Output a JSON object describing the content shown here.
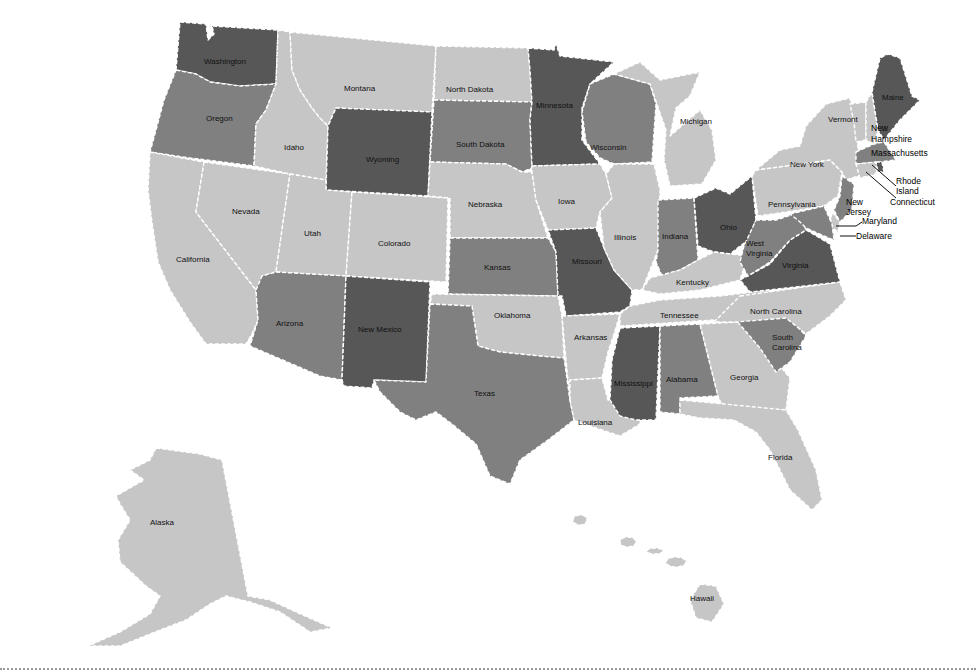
{
  "map": {
    "type": "choropleth",
    "region": "United States",
    "palette": {
      "level1": "#c6c6c6",
      "level2": "#a3a3a3",
      "level3": "#808080",
      "level4": "#575757",
      "border": "#ffffff",
      "label": "#111111"
    },
    "states": [
      {
        "id": "WA",
        "name": "Washington",
        "level": 4
      },
      {
        "id": "OR",
        "name": "Oregon",
        "level": 3
      },
      {
        "id": "CA",
        "name": "California",
        "level": 1
      },
      {
        "id": "NV",
        "name": "Nevada",
        "level": 1
      },
      {
        "id": "ID",
        "name": "Idaho",
        "level": 1
      },
      {
        "id": "MT",
        "name": "Montana",
        "level": 1
      },
      {
        "id": "WY",
        "name": "Wyoming",
        "level": 4
      },
      {
        "id": "UT",
        "name": "Utah",
        "level": 1
      },
      {
        "id": "CO",
        "name": "Colorado",
        "level": 1
      },
      {
        "id": "AZ",
        "name": "Arizona",
        "level": 3
      },
      {
        "id": "NM",
        "name": "New Mexico",
        "level": 4
      },
      {
        "id": "ND",
        "name": "North Dakota",
        "level": 1
      },
      {
        "id": "SD",
        "name": "South Dakota",
        "level": 3
      },
      {
        "id": "NE",
        "name": "Nebraska",
        "level": 1
      },
      {
        "id": "KS",
        "name": "Kansas",
        "level": 3
      },
      {
        "id": "OK",
        "name": "Oklahoma",
        "level": 1
      },
      {
        "id": "TX",
        "name": "Texas",
        "level": 3
      },
      {
        "id": "MN",
        "name": "Minnesota",
        "level": 4
      },
      {
        "id": "IA",
        "name": "Iowa",
        "level": 1
      },
      {
        "id": "MO",
        "name": "Missouri",
        "level": 4
      },
      {
        "id": "AR",
        "name": "Arkansas",
        "level": 1
      },
      {
        "id": "LA",
        "name": "Louisiana",
        "level": 1
      },
      {
        "id": "WI",
        "name": "Wisconsin",
        "level": 3
      },
      {
        "id": "IL",
        "name": "Illinois",
        "level": 1
      },
      {
        "id": "MI",
        "name": "Michigan",
        "level": 1
      },
      {
        "id": "IN",
        "name": "Indiana",
        "level": 3
      },
      {
        "id": "OH",
        "name": "Ohio",
        "level": 4
      },
      {
        "id": "KY",
        "name": "Kentucky",
        "level": 1
      },
      {
        "id": "TN",
        "name": "Tennessee",
        "level": 1
      },
      {
        "id": "MS",
        "name": "Mississippi",
        "level": 4
      },
      {
        "id": "AL",
        "name": "Alabama",
        "level": 3
      },
      {
        "id": "GA",
        "name": "Georgia",
        "level": 1
      },
      {
        "id": "FL",
        "name": "Florida",
        "level": 1
      },
      {
        "id": "SC",
        "name": "South Carolina",
        "level": 3
      },
      {
        "id": "NC",
        "name": "North Carolina",
        "level": 1
      },
      {
        "id": "VA",
        "name": "Virginia",
        "level": 4
      },
      {
        "id": "WV",
        "name": "West Virginia",
        "level": 3
      },
      {
        "id": "PA",
        "name": "Pennsylvania",
        "level": 1
      },
      {
        "id": "NY",
        "name": "New York",
        "level": 1
      },
      {
        "id": "VT",
        "name": "Vermont",
        "level": 1
      },
      {
        "id": "NH",
        "name": "New Hampshire",
        "level": 1
      },
      {
        "id": "ME",
        "name": "Maine",
        "level": 4
      },
      {
        "id": "MA",
        "name": "Massachusetts",
        "level": 3
      },
      {
        "id": "RI",
        "name": "Rhode Island",
        "level": 4
      },
      {
        "id": "CT",
        "name": "Connecticut",
        "level": 1
      },
      {
        "id": "NJ",
        "name": "New Jersey",
        "level": 3
      },
      {
        "id": "DE",
        "name": "Delaware",
        "level": 1
      },
      {
        "id": "MD",
        "name": "Maryland",
        "level": 3
      },
      {
        "id": "AK",
        "name": "Alaska",
        "level": 1
      },
      {
        "id": "HI",
        "name": "Hawaii",
        "level": 1
      }
    ],
    "labels": {
      "WA": "Washington",
      "OR": "Oregon",
      "CA": "California",
      "NV": "Nevada",
      "ID": "Idaho",
      "MT": "Montana",
      "WY": "Wyoming",
      "UT": "Utah",
      "CO": "Colorado",
      "AZ": "Arizona",
      "NM": "New Mexico",
      "ND": "North Dakota",
      "SD": "South Dakota",
      "NE": "Nebraska",
      "KS": "Kansas",
      "OK": "Oklahoma",
      "TX": "Texas",
      "MN": "Minnesota",
      "IA": "Iowa",
      "MO": "Missouri",
      "AR": "Arkansas",
      "LA": "Louisiana",
      "WI": "Wisconsin",
      "IL": "Illinois",
      "MI": "Michigan",
      "IN": "Indiana",
      "OH": "Ohio",
      "KY": "Kentucky",
      "TN": "Tennessee",
      "MS": "Mississippi",
      "AL": "Alabama",
      "GA": "Georgia",
      "FL": "Florida",
      "SC1": "South",
      "SC2": "Carolina",
      "NC": "North Carolina",
      "VA": "Virginia",
      "WV1": "West",
      "WV2": "Virginia",
      "PA": "Pennsylvania",
      "NY": "New York",
      "VT": "Vermont",
      "ME": "Maine",
      "AK": "Alaska",
      "HI": "Hawaii"
    },
    "callouts": {
      "NH1": "New",
      "NH2": "Hampshire",
      "MA": "Massachusetts",
      "RI1": "Rhode",
      "RI2": "Island",
      "CT": "Connecticut",
      "NJ1": "New",
      "NJ2": "Jersey",
      "MD": "Maryland",
      "DE": "Delaware"
    }
  }
}
